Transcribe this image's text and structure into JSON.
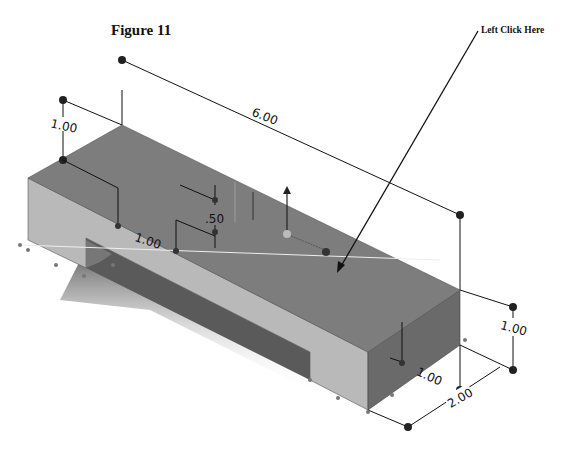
{
  "figure": {
    "title": "Figure 11",
    "callout_label": "Left Click Here"
  },
  "dimensions": {
    "length": "6.00",
    "height_left": "1.00",
    "slot_width": "1.00",
    "slot_depth": ".50",
    "height_right": "1.00",
    "front_width": "1.00",
    "depth": "2.00"
  },
  "colors": {
    "top_face": "#7d7d7d",
    "front_face": "#b9b9b9",
    "right_face": "#6a6a6a",
    "slot_inner": "#4a4a4a",
    "dimension_line": "#111111",
    "background": "#ffffff"
  }
}
